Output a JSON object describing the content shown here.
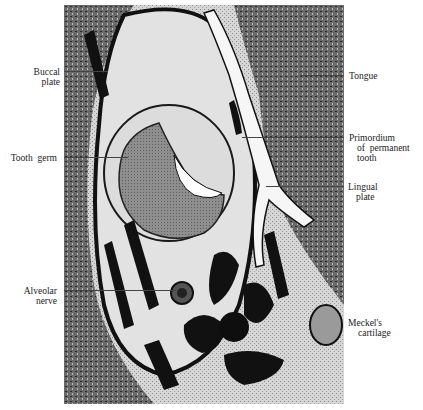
{
  "figure": {
    "type": "histological section (micrograph)",
    "background_color": "#ffffff",
    "labels_left": [
      {
        "id": "buccal-plate",
        "line1": "Buccal",
        "line2": "plate"
      },
      {
        "id": "tooth-germ",
        "line1": "Tooth  germ",
        "line2": ""
      },
      {
        "id": "alveolar-nerve",
        "line1": "Alveolar",
        "line2": "nerve"
      }
    ],
    "labels_right": [
      {
        "id": "tongue",
        "line1": "Tongue",
        "line2": "",
        "line3": ""
      },
      {
        "id": "primordium",
        "line1": "Primordium",
        "line2": "of  permanent",
        "line3": "tooth"
      },
      {
        "id": "lingual-plate",
        "line1": "Lingual",
        "line2": "plate",
        "line3": ""
      },
      {
        "id": "meckels-cartilage",
        "line1": "Meckel's",
        "line2": "cartilage",
        "line3": ""
      }
    ]
  }
}
